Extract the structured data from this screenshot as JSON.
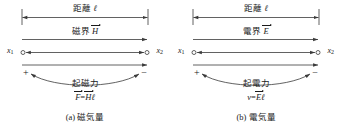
{
  "figure": {
    "panels": [
      {
        "id": "a",
        "distance_label": "距離",
        "distance_symbol": "ℓ",
        "field_label": "磁界",
        "field_symbol": "H",
        "terminal_left": "x",
        "terminal_left_sub": "1",
        "terminal_right": "x",
        "terminal_right_sub": "2",
        "polarity_left": "+",
        "polarity_right": "−",
        "force_label": "起磁力",
        "formula_lhs": "F",
        "formula_eq": "=",
        "formula_rhs_vec": "H",
        "formula_rhs_len": "ℓ",
        "caption": "(a) 磁気量"
      },
      {
        "id": "b",
        "distance_label": "距離",
        "distance_symbol": "ℓ",
        "field_label": "電界",
        "field_symbol": "E",
        "terminal_left": "x",
        "terminal_left_sub": "1",
        "terminal_right": "x",
        "terminal_right_sub": "2",
        "polarity_left": "+",
        "polarity_right": "−",
        "force_label": "起電力",
        "formula_lhs": "v",
        "formula_eq": "=",
        "formula_rhs_vec": "E",
        "formula_rhs_len": "ℓ",
        "caption": "(b) 電気量"
      }
    ],
    "colors": {
      "ink": "#1a1a1a",
      "line": "#3a3a3a",
      "background": "#ffffff"
    }
  }
}
